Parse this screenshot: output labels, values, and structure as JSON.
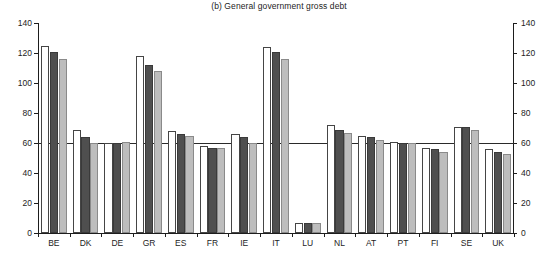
{
  "chart_data": {
    "type": "bar",
    "title": "(b) General government gross debt",
    "xlabel": "",
    "ylabel": "",
    "ylim": [
      0,
      140
    ],
    "yticks": [
      0,
      20,
      40,
      60,
      80,
      100,
      120,
      140
    ],
    "grid": false,
    "legend": "none",
    "dual_axis": true,
    "reference_line": 60,
    "bar_group_count": 3,
    "categories": [
      "BE",
      "DK",
      "DE",
      "GR",
      "ES",
      "FR",
      "IE",
      "IT",
      "LU",
      "NL",
      "AT",
      "PT",
      "FI",
      "SE",
      "UK"
    ],
    "series": [
      {
        "name": "series-1",
        "style": "white",
        "color": "#ffffff",
        "values": [
          125,
          69,
          60,
          118,
          68,
          58,
          66,
          124,
          7,
          72,
          65,
          61,
          57,
          71,
          56
        ]
      },
      {
        "name": "series-2",
        "style": "dark-gray",
        "color": "#4f4f4f",
        "values": [
          121,
          64,
          60,
          112,
          66,
          57,
          64,
          121,
          7,
          69,
          64,
          60,
          56,
          71,
          54
        ]
      },
      {
        "name": "series-3",
        "style": "light-gray",
        "color": "#bdbdbd",
        "values": [
          116,
          60,
          61,
          108,
          65,
          57,
          60,
          116,
          7,
          67,
          62,
          60,
          54,
          69,
          53
        ]
      }
    ]
  },
  "axes": {
    "left_tick_labels": [
      "140",
      "120",
      "100",
      "80",
      "60",
      "40",
      "20",
      "0"
    ],
    "right_tick_labels": [
      "140",
      "120",
      "100",
      "80",
      "60",
      "40",
      "20",
      "0"
    ]
  }
}
